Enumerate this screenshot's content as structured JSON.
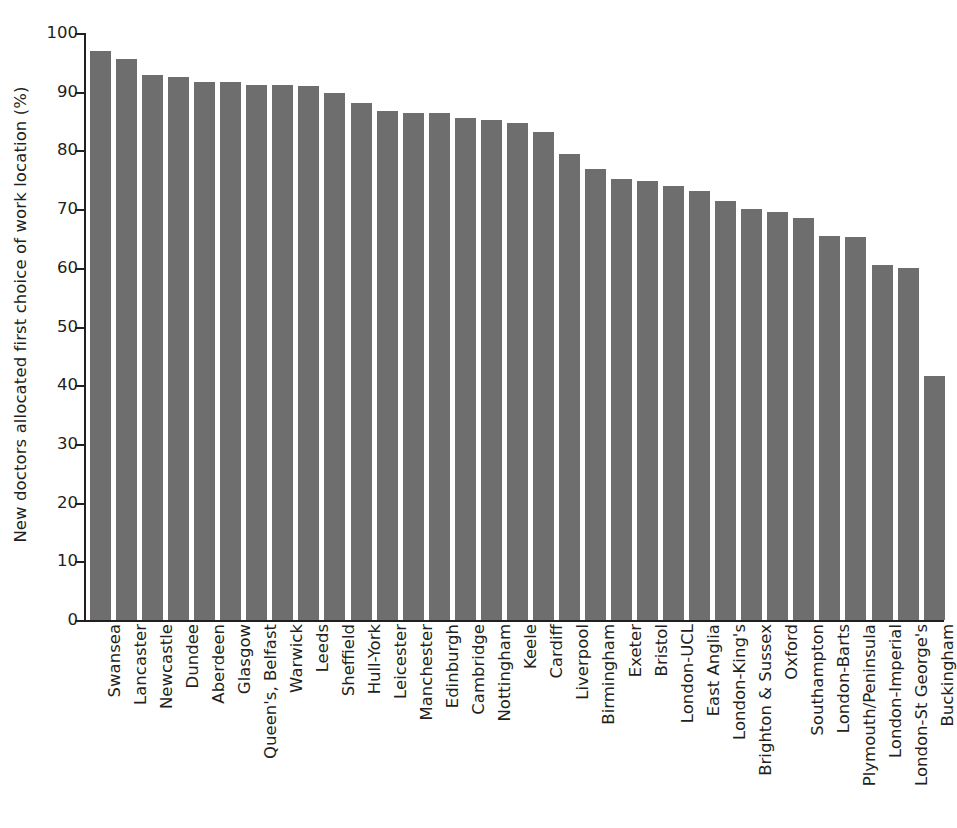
{
  "chart": {
    "type": "bar",
    "ylabel": "New doctors allocated first choice of work location (%)",
    "bar_color": "#6e6e6e",
    "axis_color": "#231f20",
    "background": "#ffffff"
  },
  "chart_data": {
    "type": "bar",
    "title": "",
    "xlabel": "",
    "ylabel": "New doctors allocated first choice of work location (%)",
    "ylim": [
      0,
      100
    ],
    "yticks": [
      0,
      10,
      20,
      30,
      40,
      50,
      60,
      70,
      80,
      90,
      100
    ],
    "ytick_labels": [
      "0",
      "10",
      "20",
      "30",
      "40",
      "50",
      "60",
      "70",
      "80",
      "90",
      "100"
    ],
    "grid": false,
    "legend": false,
    "orientation": "vertical",
    "bar_color": "#6e6e6e",
    "categories": [
      "Swansea",
      "Lancaster",
      "Newcastle",
      "Dundee",
      "Aberdeen",
      "Glasgow",
      "Queen's, Belfast",
      "Warwick",
      "Leeds",
      "Sheffield",
      "Hull-York",
      "Leicester",
      "Manchester",
      "Edinburgh",
      "Cambridge",
      "Nottingham",
      "Keele",
      "Cardiff",
      "Liverpool",
      "Birmingham",
      "Exeter",
      "Bristol",
      "London-UCL",
      "East Anglia",
      "London-King's",
      "Brighton & Sussex",
      "Oxford",
      "Southampton",
      "London-Barts",
      "Plymouth/Peninsula",
      "London-Imperial",
      "London-St George's",
      "Buckingham"
    ],
    "values": [
      96.9,
      95.6,
      92.8,
      92.5,
      91.6,
      91.6,
      91.1,
      91.1,
      91.0,
      89.8,
      88.1,
      86.7,
      86.3,
      86.3,
      85.6,
      85.1,
      84.6,
      83.2,
      79.4,
      76.8,
      75.2,
      74.8,
      74.0,
      73.1,
      71.4,
      70.1,
      69.5,
      68.5,
      65.4,
      65.2,
      60.5,
      59.9,
      41.5
    ]
  }
}
